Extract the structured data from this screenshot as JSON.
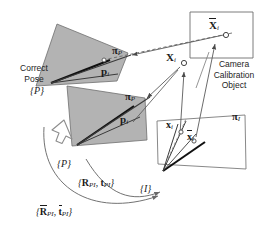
{
  "figure": {
    "type": "camera-calibration-pose-diagram",
    "background": "#ffffff",
    "width": 277,
    "height": 235
  },
  "annotations": {
    "correct_pose_line1": "Correct",
    "correct_pose_line2": "Pose",
    "calib_line1": "Camera",
    "calib_line2": "Calibration",
    "calib_line3": "Object"
  },
  "frames": {
    "pose_correct": "{P}",
    "pose_estimated": "{P}",
    "image": "{I}"
  },
  "planes": {
    "pattern_correct_label": "π",
    "pattern_correct_sub": "P",
    "pattern_estimated_label": "π",
    "pattern_estimated_sub": "P",
    "image_plane_label": "π",
    "image_plane_sub": "I",
    "fill": "#b3b3b3",
    "stroke": "#5a5a5a"
  },
  "points": {
    "p_correct": "p",
    "p_correct_sub": "i",
    "p_estimated": "p",
    "p_estimated_sub": "i",
    "X_bar": "X",
    "X_bar_sub": "i",
    "X": "X",
    "X_sub": "i",
    "x_small": "x",
    "x_small_sub": "i",
    "x_bar_small": "x",
    "x_bar_small_sub": "i"
  },
  "transforms": {
    "estimated_label_R": "R",
    "estimated_label_t": "t",
    "estimated_sub": "PI",
    "correct_label_R": "R",
    "correct_label_t": "t",
    "correct_sub": "PI"
  },
  "colors": {
    "line": "#3a3a3a",
    "plane_fill": "#b3b3b3",
    "thick_vector": "#111111",
    "hollow_arrow_stroke": "#8d8d8d"
  }
}
